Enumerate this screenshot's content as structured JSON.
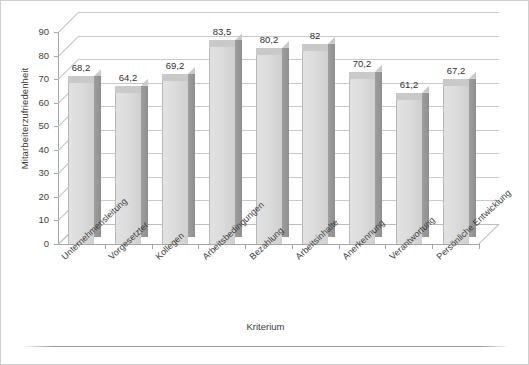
{
  "chart_data": {
    "type": "bar",
    "title": "",
    "subtitle": "",
    "xlabel": "Kriterium",
    "ylabel": "Mitarbeiterzufriedenheit",
    "ylim": [
      0,
      90
    ],
    "ytick_step": 10,
    "grid": true,
    "legend": "none",
    "style": "3d-column",
    "categories": [
      "Unternehmensleitung",
      "Vorgesetzter",
      "Kollegen",
      "Arbeitsbedingungen",
      "Bezahlung",
      "Arbeitsinhalte",
      "Anerkennung",
      "Verantwortung",
      "Persönliche Entwicklung"
    ],
    "values": [
      68.2,
      64.2,
      69.2,
      83.5,
      80.2,
      82,
      70.2,
      61.2,
      67.2
    ],
    "data_labels": [
      "68,2",
      "64,2",
      "69,2",
      "83,5",
      "80,2",
      "82",
      "70,2",
      "61,2",
      "67,2"
    ],
    "ytick_labels": [
      "90",
      "80",
      "70",
      "60",
      "50",
      "40",
      "30",
      "20",
      "10",
      "0"
    ],
    "colors": {
      "bar_front": "#dcdcdc",
      "bar_side": "#9a9a9a",
      "bar_top": "#c9c9c9",
      "gridline": "#c9c9c9",
      "axis": "#a6a6a6",
      "text": "#3a3a3a",
      "background": "#ffffff",
      "border": "#cfcfcf"
    }
  }
}
